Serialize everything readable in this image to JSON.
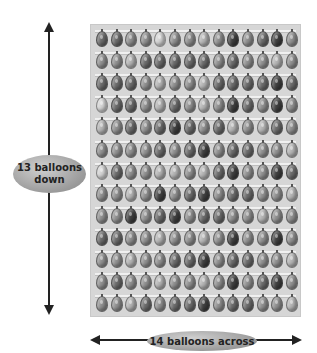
{
  "labels": {
    "down_line1": "13 balloons",
    "down_line2": "down",
    "across": "14 balloons across"
  },
  "grid": {
    "rows": 13,
    "columns": 14,
    "shades": [
      [
        4,
        4,
        3,
        3,
        1,
        3,
        3,
        2,
        3,
        5,
        3,
        4,
        5,
        3
      ],
      [
        3,
        3,
        2,
        4,
        4,
        4,
        4,
        4,
        3,
        4,
        3,
        3,
        2,
        3
      ],
      [
        4,
        4,
        4,
        3,
        2,
        3,
        3,
        2,
        4,
        4,
        4,
        4,
        5,
        4
      ],
      [
        1,
        4,
        4,
        3,
        2,
        4,
        3,
        2,
        3,
        5,
        4,
        3,
        5,
        3
      ],
      [
        2,
        3,
        4,
        3,
        4,
        5,
        4,
        3,
        4,
        2,
        3,
        2,
        4,
        3
      ],
      [
        3,
        3,
        3,
        3,
        4,
        3,
        4,
        5,
        3,
        4,
        4,
        3,
        3,
        2
      ],
      [
        1,
        4,
        3,
        3,
        2,
        2,
        3,
        2,
        4,
        5,
        3,
        3,
        5,
        4
      ],
      [
        3,
        3,
        2,
        3,
        5,
        3,
        4,
        5,
        3,
        4,
        4,
        3,
        3,
        2
      ],
      [
        3,
        3,
        5,
        3,
        4,
        5,
        3,
        4,
        4,
        3,
        3,
        2,
        3,
        3
      ],
      [
        4,
        4,
        3,
        3,
        2,
        3,
        3,
        2,
        3,
        5,
        3,
        3,
        5,
        3
      ],
      [
        3,
        3,
        2,
        3,
        3,
        4,
        4,
        5,
        3,
        4,
        4,
        3,
        3,
        2
      ],
      [
        3,
        4,
        3,
        3,
        2,
        3,
        3,
        2,
        3,
        5,
        3,
        4,
        5,
        3
      ],
      [
        3,
        3,
        2,
        4,
        3,
        4,
        4,
        5,
        3,
        4,
        4,
        3,
        3,
        2
      ]
    ]
  },
  "colors": {
    "panel_background": "#d6d6d6",
    "arrow": "#222222",
    "label_fill": "#a8a8a8"
  }
}
